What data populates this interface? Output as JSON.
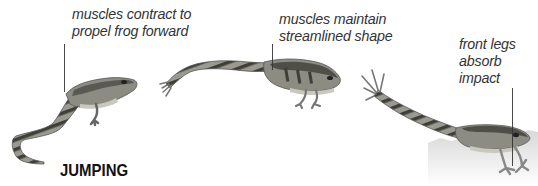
{
  "diagram": {
    "title": "JUMPING",
    "annotations": [
      {
        "id": "contract",
        "lines": [
          "muscles contract to",
          "propel frog forward"
        ],
        "stage": 1
      },
      {
        "id": "streamlined",
        "lines": [
          "muscles maintain",
          "streamlined shape"
        ],
        "stage": 2
      },
      {
        "id": "absorb",
        "lines": [
          "front legs",
          "absorb",
          "impact"
        ],
        "stage": 3
      }
    ],
    "stages": [
      {
        "name": "launch",
        "description": "frog pushing off with hind legs extended"
      },
      {
        "name": "mid-air",
        "description": "frog fully stretched in flight"
      },
      {
        "name": "landing",
        "description": "frog landing on front legs"
      }
    ],
    "colors": {
      "text": "#333333",
      "frog_body": "#8a8a80",
      "frog_stripes": "#3c3c36",
      "frog_belly": "#c8c8bc",
      "ground": "#e6e6e6"
    }
  }
}
